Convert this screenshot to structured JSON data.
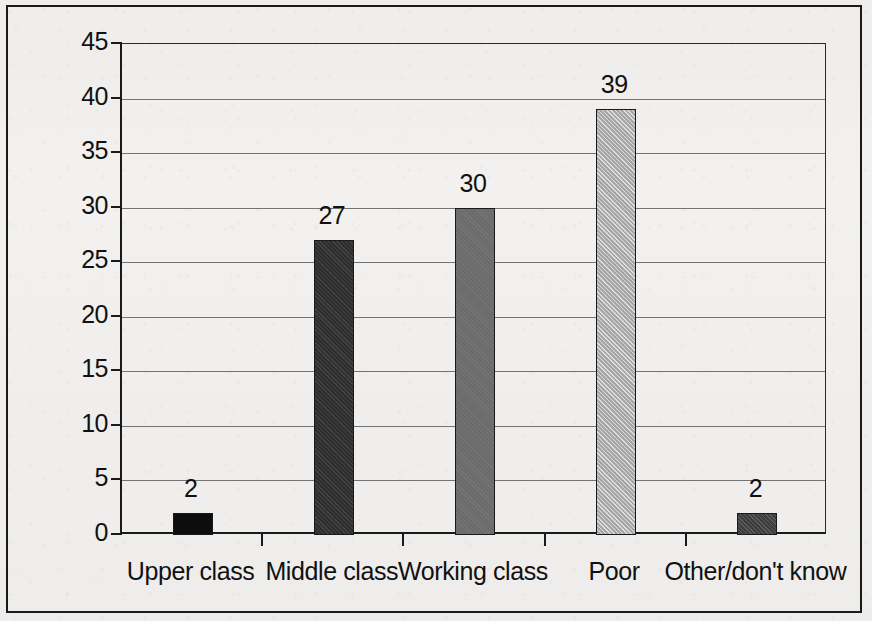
{
  "chart_data": {
    "type": "bar",
    "title": "",
    "subtitle": "",
    "xlabel": "",
    "ylabel": "",
    "categories": [
      "Upper class",
      "Middle class",
      "Working class",
      "Poor",
      "Other/don't know"
    ],
    "values": [
      2,
      27,
      30,
      39,
      2
    ],
    "value_labels": [
      "2",
      "27",
      "30",
      "39",
      "2"
    ],
    "ylim": [
      0,
      45
    ],
    "ytick_labels": [
      "0",
      "5",
      "10",
      "15",
      "20",
      "25",
      "30",
      "35",
      "40",
      "45"
    ],
    "ytick_values": [
      0,
      5,
      10,
      15,
      20,
      25,
      30,
      35,
      40,
      45
    ],
    "grid": "horizontal",
    "legend": "none",
    "bar_styles": [
      {
        "category": "Upper class",
        "fill": "solid-black",
        "color": "#0d0d0d"
      },
      {
        "category": "Middle class",
        "fill": "hatch-dark",
        "color": "#2e2e2e"
      },
      {
        "category": "Working class",
        "fill": "gray-mid",
        "color": "#6b6b6b"
      },
      {
        "category": "Poor",
        "fill": "hatch-light",
        "color": "#b3b3b3"
      },
      {
        "category": "Other/don't know",
        "fill": "hatch-darkgray",
        "color": "#3d3d3d"
      }
    ],
    "axis_color": "#1a1a1a",
    "gridline_color": "#737373",
    "background_color": "#f2f1ef"
  }
}
